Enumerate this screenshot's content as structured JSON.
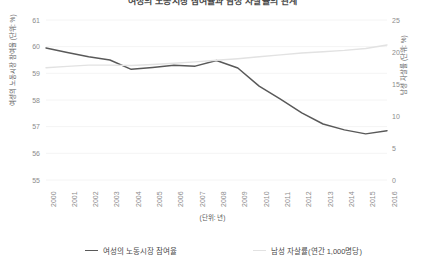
{
  "chart_data": {
    "type": "line",
    "title": "여성의 노동시장 참여율과 남성 자살률의 관계",
    "xlabel": "(단위: 년)",
    "ylabel": "여성의 노동시장 참여율 (단위: %)",
    "y2label": "남성 자살률 (단위: %)",
    "categories": [
      "2000",
      "2001",
      "2002",
      "2003",
      "2004",
      "2005",
      "2006",
      "2007",
      "2008",
      "2009",
      "2010",
      "2011",
      "2012",
      "2013",
      "2014",
      "2015",
      "2016"
    ],
    "ylim": [
      55,
      61
    ],
    "yticks": [
      "61",
      "60",
      "59",
      "58",
      "57",
      "56",
      "55"
    ],
    "y2lim": [
      0,
      25
    ],
    "y2ticks": [
      "25",
      "20",
      "15",
      "10",
      "5",
      "0"
    ],
    "grid": true,
    "legend_position": "bottom",
    "series": [
      {
        "name": "여성의 노동시장 참여율",
        "axis": "left",
        "color": "#595959",
        "values": [
          59.95,
          59.78,
          59.62,
          59.5,
          59.15,
          59.22,
          59.3,
          59.27,
          59.48,
          59.2,
          58.52,
          58.03,
          57.52,
          57.1,
          56.88,
          56.73,
          56.85
        ]
      },
      {
        "name": "남성 자살률(연간 1,000명당)",
        "axis": "right",
        "color": "#e2e2e2",
        "values": [
          17.55,
          17.75,
          17.95,
          17.95,
          17.9,
          18.05,
          18.25,
          18.45,
          18.7,
          18.95,
          19.25,
          19.55,
          19.85,
          20.05,
          20.25,
          20.55,
          21.1
        ]
      }
    ]
  },
  "legend": {
    "entries": [
      {
        "label": "여성의 노동시장 참여율",
        "color": "#595959"
      },
      {
        "label": "남성 자살률(연간 1,000명당)",
        "color": "#e2e2e2"
      }
    ]
  },
  "colors": {
    "background": "#ffffff",
    "grid": "#f4f4f4",
    "tick_text": "#8c8c8c",
    "axis_title": "#5a5a5a",
    "series_primary": "#595959",
    "series_secondary": "#e2e2e2"
  }
}
